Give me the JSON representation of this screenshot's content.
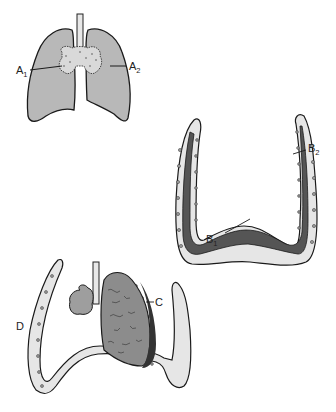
{
  "diagram": {
    "type": "anatomical illustration",
    "panels": [
      {
        "id": "top-left",
        "description": "Pair of lungs with trachea and hilar region",
        "labels": [
          "A1",
          "A2"
        ]
      },
      {
        "id": "middle-right",
        "description": "Pleural layers around thoracic cavity (U-shape)",
        "labels": [
          "B1",
          "B2"
        ]
      },
      {
        "id": "bottom-left",
        "description": "Collapsed lung with pleural effusion; chest wall",
        "labels": [
          "C",
          "D"
        ]
      }
    ]
  },
  "labels": {
    "a1": {
      "main": "A",
      "sub": "1"
    },
    "a2": {
      "main": "A",
      "sub": "2"
    },
    "b1": {
      "main": "B",
      "sub": "1"
    },
    "b2": {
      "main": "B",
      "sub": "2"
    },
    "c": {
      "main": "C"
    },
    "d": {
      "main": "D"
    }
  },
  "colors": {
    "lung_fill": "#b8b8b8",
    "pleura_dark": "#555555",
    "pleura_light": "#e6e6e6",
    "outline": "#1a1a1a"
  }
}
